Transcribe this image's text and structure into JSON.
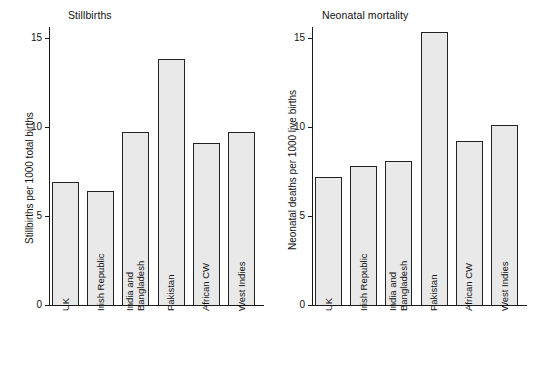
{
  "figure": {
    "background": "#ffffff",
    "bar_fill": "#e9e9e9",
    "bar_edge": "#222222",
    "axis_color": "#1a1a1a"
  },
  "chart_data": [
    {
      "type": "bar",
      "title": "Stillbirths",
      "xlabel": "",
      "ylabel": "Stillbirths per 1000 total births",
      "categories": [
        "UK",
        "Irish Republic",
        "India and Bangladesh",
        "Pakistan",
        "African CW",
        "West Indies"
      ],
      "category_lines": [
        [
          "UK"
        ],
        [
          "Irish Republic"
        ],
        [
          "India and",
          "Bangladesh"
        ],
        [
          "Pakistan"
        ],
        [
          "African CW"
        ],
        [
          "West Indies"
        ]
      ],
      "values": [
        6.9,
        6.4,
        9.7,
        13.8,
        9.1,
        9.7
      ],
      "ylim": [
        0,
        15.6
      ],
      "yticks": [
        0,
        5,
        10,
        15
      ],
      "ytick_labels": [
        "0",
        "5",
        "10",
        "15"
      ],
      "grid": false,
      "legend": "none"
    },
    {
      "type": "bar",
      "title": "Neonatal mortality",
      "xlabel": "",
      "ylabel": "Neonatal deaths per 1000 live births",
      "categories": [
        "UK",
        "Irish Republic",
        "India and Bangladesh",
        "Pakistan",
        "African CW",
        "West Indies"
      ],
      "category_lines": [
        [
          "UK"
        ],
        [
          "Irish Republic"
        ],
        [
          "India and",
          "Bangladesh"
        ],
        [
          "Pakistan"
        ],
        [
          "African CW"
        ],
        [
          "West Indies"
        ]
      ],
      "values": [
        7.2,
        7.8,
        8.1,
        15.3,
        9.2,
        10.1
      ],
      "ylim": [
        0,
        15.6
      ],
      "yticks": [
        0,
        5,
        10,
        15
      ],
      "ytick_labels": [
        "0",
        "5",
        "10",
        "15"
      ],
      "grid": false,
      "legend": "none"
    }
  ]
}
